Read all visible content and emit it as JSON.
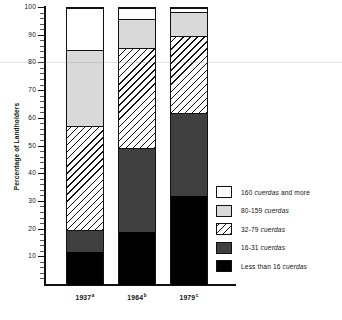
{
  "chart_data": {
    "type": "bar",
    "subtype": "stacked-bar-100-percent",
    "title": "",
    "xlabel": "",
    "ylabel": "Percentage of Landholders",
    "ylim": [
      0,
      100
    ],
    "yticks": [
      10,
      20,
      30,
      40,
      50,
      60,
      70,
      80,
      90,
      100
    ],
    "grid": false,
    "legend_position": "right",
    "categories": [
      "1937",
      "1964",
      "1979"
    ],
    "category_notes": [
      "a",
      "b",
      "c"
    ],
    "category_labels": [
      "1937a",
      "1964b",
      "1979c"
    ],
    "series": [
      {
        "name": "Less than 16 cuerdas",
        "fill": "black",
        "values": [
          12.0,
          19.0,
          32.0
        ]
      },
      {
        "name": "16-31 cuerdas",
        "fill": "darkgray",
        "values": [
          8.0,
          30.5,
          30.0
        ]
      },
      {
        "name": "32-79 cuerdas",
        "fill": "hatched",
        "values": [
          37.5,
          36.0,
          28.0
        ]
      },
      {
        "name": "80-159 cuerdas",
        "fill": "lightgray",
        "values": [
          27.5,
          10.5,
          8.5
        ]
      },
      {
        "name": "160 cuerdas and more",
        "fill": "white",
        "values": [
          15.0,
          4.0,
          1.5
        ]
      }
    ],
    "cumulative_tops": {
      "1937": [
        12.0,
        20.0,
        57.5,
        85.0,
        100.0
      ],
      "1964": [
        19.0,
        49.5,
        85.5,
        96.0,
        100.0
      ],
      "1979": [
        32.0,
        62.0,
        90.0,
        98.5,
        100.0
      ]
    }
  },
  "axis": {
    "y_title": "Percentage of Landholders",
    "y_ticks": [
      "100",
      "90",
      "80",
      "70",
      "60",
      "50",
      "40",
      "30",
      "20",
      "10"
    ],
    "x_labels": [
      {
        "year": "1937",
        "note": "a"
      },
      {
        "year": "1964",
        "note": "b"
      },
      {
        "year": "1979",
        "note": "c"
      }
    ]
  },
  "legend": {
    "items": [
      {
        "label_pre": "160 ",
        "label_em": "cuerdas",
        "label_post": " and more",
        "swatch": "white"
      },
      {
        "label_pre": "80-159 ",
        "label_em": "cuerdas",
        "label_post": "",
        "swatch": "light-gray"
      },
      {
        "label_pre": "32-79 ",
        "label_em": "cuerdas",
        "label_post": "",
        "swatch": "hatched-diagonal"
      },
      {
        "label_pre": "16-31 ",
        "label_em": "cuerdas",
        "label_post": "",
        "swatch": "dark-gray"
      },
      {
        "label_pre": "Less than 16 ",
        "label_em": "cuerdas",
        "label_post": "",
        "swatch": "black"
      }
    ]
  },
  "colors": {
    "axis": "#111111",
    "white": "#ffffff",
    "light_gray": "#d9d9d9",
    "dark_gray": "#3f3f3f",
    "black": "#000000"
  }
}
